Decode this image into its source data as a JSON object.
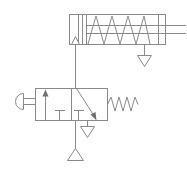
{
  "diagram": {
    "type": "fluid-power-schematic",
    "background_color": "#ffffff",
    "line_color": "#8a8a8a",
    "arrow_fill_color": "#6f6f6f",
    "canvas": {
      "width": 186,
      "height": 169
    },
    "components": [
      {
        "id": "cylinder",
        "name": "single-acting-spring-return-cylinder",
        "label": "",
        "body": {
          "x": 69,
          "y": 14,
          "width": 97,
          "height": 31
        },
        "cap_line_x": 78,
        "piston": {
          "x": 82,
          "width": 4
        },
        "rod": {
          "y_top": 25,
          "y_bottom": 33,
          "x_end": 186
        },
        "spring_coils": 4,
        "port_inlet": {
          "x": 75,
          "y": 45,
          "name": "inlet-port-arrow"
        },
        "exhaust": {
          "x": 144,
          "y": 45,
          "name": "cylinder-exhaust-triangle"
        }
      },
      {
        "id": "valve",
        "name": "three-two-way-valve",
        "label": "",
        "box_left": {
          "x": 35,
          "y": 88,
          "width": 36,
          "height": 32
        },
        "box_right": {
          "x": 71,
          "y": 88,
          "width": 36,
          "height": 32
        },
        "left_square_symbol": "straight-through-arrow-up",
        "right_square_symbol": "diagonal-crossover-arrow",
        "blocked_port_left": "T-stop",
        "blocked_port_right": "T-stop",
        "actuator": {
          "name": "pushbutton-actuator",
          "side": "left"
        },
        "return": {
          "name": "return-spring",
          "side": "right",
          "coils": 4
        }
      },
      {
        "id": "supply",
        "name": "pressure-supply-triangle",
        "label": "",
        "x": 75,
        "y": 148
      },
      {
        "id": "valve-exhaust",
        "name": "valve-exhaust-triangle",
        "label": "",
        "x": 87,
        "y": 122
      }
    ],
    "connections": [
      {
        "name": "valve-to-cylinder-line",
        "from": "valve-port-A",
        "to": "cylinder-inlet"
      },
      {
        "name": "supply-to-valve-line",
        "from": "pressure-supply",
        "to": "valve-port-P"
      }
    ]
  }
}
